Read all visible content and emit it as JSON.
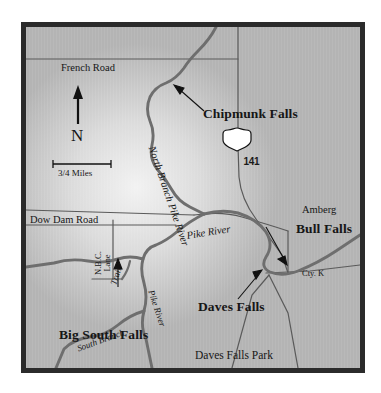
{
  "figure": {
    "kind": "locator-map"
  },
  "colors": {
    "frame": "#2b2b2b",
    "map_field": "#b3b3b3",
    "map_highlight": "#f0f0f0",
    "river": "#6e6e6e",
    "road": "#5a5a5a",
    "label": "#161616",
    "shield_fill": "#ffffff",
    "page_background": "#ffffff"
  },
  "compass": {
    "name": "north-arrow",
    "letter": "N"
  },
  "scalebar": {
    "label": "3/4 Miles"
  },
  "route_shield": {
    "type": "us-highway-shield",
    "number": "141"
  },
  "falls": [
    {
      "id": "chipmunk",
      "label": "Chipmunk Falls",
      "has_arrow": true
    },
    {
      "id": "bull",
      "label": "Bull Falls",
      "has_arrow": true
    },
    {
      "id": "daves",
      "label": "Daves Falls",
      "has_arrow": true
    },
    {
      "id": "big-south",
      "label": "Big South Falls",
      "has_arrow": true
    }
  ],
  "places": [
    {
      "id": "amberg",
      "label": "Amberg"
    },
    {
      "id": "daves-falls-park",
      "label": "Daves Falls Park"
    }
  ],
  "roads": [
    {
      "id": "french-road",
      "label": "French Road"
    },
    {
      "id": "dow-dam-road",
      "label": "Dow Dam Road"
    },
    {
      "id": "nbc-lane",
      "label_line1": "N.B.C.",
      "label_line2": "Lane"
    },
    {
      "id": "cty-k",
      "label": "Cty. K"
    }
  ],
  "trails": [
    {
      "id": "trail",
      "label": "Trail"
    }
  ],
  "rivers": [
    {
      "id": "north-branch-pike-river",
      "label": "North Branch Pike River"
    },
    {
      "id": "pike-river-main",
      "label": "Pike River"
    },
    {
      "id": "pike-river-south",
      "label": "Pike River"
    },
    {
      "id": "south-branch",
      "label": "South Branch"
    }
  ]
}
